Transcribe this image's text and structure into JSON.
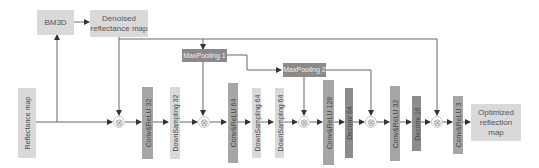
{
  "diagram": {
    "inputs": {
      "reflectance_map": "Reflectance map"
    },
    "denoise_branch": {
      "bm3d": "BM3D",
      "denoised_map": "Denoised reflectance map"
    },
    "pooling": {
      "maxpool1": "MaxPooling 1",
      "maxpool2": "MaxPooling 2"
    },
    "layers": [
      {
        "id": "conv1",
        "label": "Conv&ReLU 32",
        "type": "conv"
      },
      {
        "id": "down1",
        "label": "DownSampling 32",
        "type": "downsample"
      },
      {
        "id": "conv2",
        "label": "Conv&ReLU 64",
        "type": "conv"
      },
      {
        "id": "down2",
        "label": "DownSampling 64",
        "type": "downsample"
      },
      {
        "id": "down3",
        "label": "DownSampling 64",
        "type": "downsample"
      },
      {
        "id": "conv3",
        "label": "Conv&ReLU 128",
        "type": "conv"
      },
      {
        "id": "deconv1",
        "label": "Deconv 64",
        "type": "deconv"
      },
      {
        "id": "conv4",
        "label": "Conv&ReLU 32",
        "type": "conv"
      },
      {
        "id": "deconv2",
        "label": "Deconv 16",
        "type": "deconv"
      },
      {
        "id": "conv5",
        "label": "Conv&ReLU 3",
        "type": "conv"
      }
    ],
    "output": {
      "optimized_map": "Optimized reflection map"
    },
    "multiply_symbol": "⊗",
    "colors": {
      "light_box": "#d9d9d9",
      "conv_box": "#a6a6a6",
      "deconv_box": "#8c8c8c",
      "maxpool_box": "#8a8a8a",
      "line": "#555555"
    }
  }
}
